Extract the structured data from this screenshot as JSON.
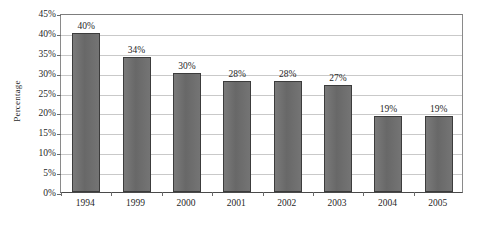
{
  "chart_data": {
    "type": "bar",
    "title": "",
    "subtitle": "",
    "xlabel": "",
    "ylabel": "Percentage",
    "categories": [
      "1994",
      "1999",
      "2000",
      "2001",
      "2002",
      "2003",
      "2004",
      "2005"
    ],
    "values": [
      40,
      34,
      30,
      28,
      28,
      27,
      19,
      19
    ],
    "data_labels": [
      "40%",
      "34%",
      "30%",
      "28%",
      "28%",
      "27%",
      "19%",
      "19%"
    ],
    "ylim": [
      0,
      45
    ],
    "ytick_values": [
      0,
      5,
      10,
      15,
      20,
      25,
      30,
      35,
      40,
      45
    ],
    "ytick_labels": [
      "0%",
      "5%",
      "10%",
      "15%",
      "20%",
      "25%",
      "30%",
      "35%",
      "40%",
      "45%"
    ],
    "grid": "horizontal",
    "legend": "none",
    "bar_color": "#6e6e6e",
    "bar_border_color": "#3c3c3c",
    "gridline_color": "#c9c9c9",
    "axis_color": "#4a4a4a",
    "plot_background": "#ffffff"
  }
}
